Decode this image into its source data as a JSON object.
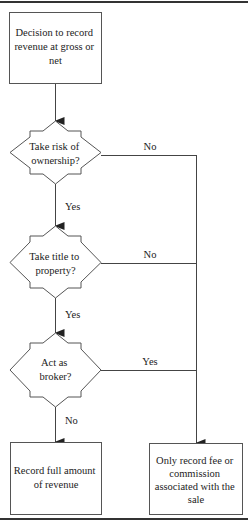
{
  "diagram": {
    "type": "flowchart",
    "start": {
      "id": "start",
      "lines": [
        "Decision to record",
        "revenue at gross or",
        "net"
      ]
    },
    "decisions": [
      {
        "id": "d1",
        "lines": [
          "Take risk of",
          "ownership?"
        ],
        "yes_label": "Yes",
        "no_label": "No",
        "side_branch": "No"
      },
      {
        "id": "d2",
        "lines": [
          "Take title to",
          "property?"
        ],
        "yes_label": "Yes",
        "no_label": "No",
        "side_branch": "No"
      },
      {
        "id": "d3",
        "lines": [
          "Act as",
          "broker?"
        ],
        "down_label": "No",
        "side_label": "Yes",
        "side_branch": "Yes"
      }
    ],
    "outcomes": {
      "gross": {
        "id": "gross",
        "lines": [
          "Record full amount",
          "of revenue"
        ]
      },
      "net": {
        "id": "net",
        "lines": [
          "Only record fee or",
          "commission",
          "associated with the",
          "sale"
        ]
      }
    },
    "edge_labels": {
      "d1_side": "No",
      "d1_down": "Yes",
      "d2_side": "No",
      "d2_down": "Yes",
      "d3_side": "Yes",
      "d3_down": "No"
    }
  }
}
